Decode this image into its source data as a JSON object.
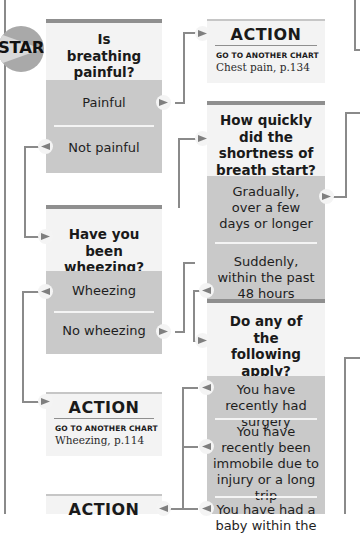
{
  "start": {
    "label": "START"
  },
  "questions": [
    {
      "id": "q-breathing-painful",
      "title": "Is breathing painful?",
      "options": [
        "Painful",
        "Not painful"
      ]
    },
    {
      "id": "q-how-quickly",
      "title": "How quickly did the shortness of breath start?",
      "options": [
        "Gradually, over a few days or longer",
        "Suddenly, within the past 48 hours"
      ]
    },
    {
      "id": "q-wheezing",
      "title": "Have you been wheezing?",
      "options": [
        "Wheezing",
        "No wheezing"
      ]
    },
    {
      "id": "q-any-apply",
      "title": "Do any of the following apply?",
      "options": [
        "You have recently had surgery",
        "You have recently been immobile due to injury or a long trip",
        "You have had a baby within the"
      ]
    }
  ],
  "actions": [
    {
      "title": "ACTION",
      "subtitle": "GO TO ANOTHER CHART",
      "reference": "Chest pain, p.134"
    },
    {
      "title": "ACTION",
      "subtitle": "GO TO ANOTHER CHART",
      "reference": "Wheezing, p.114"
    },
    {
      "title": "ACTION"
    }
  ],
  "colors": {
    "connector": "#8a8a8a",
    "option_fill": "#c9c9c9",
    "panel_fill": "#f3f3f3",
    "start_circle": "#a9a9a9"
  }
}
